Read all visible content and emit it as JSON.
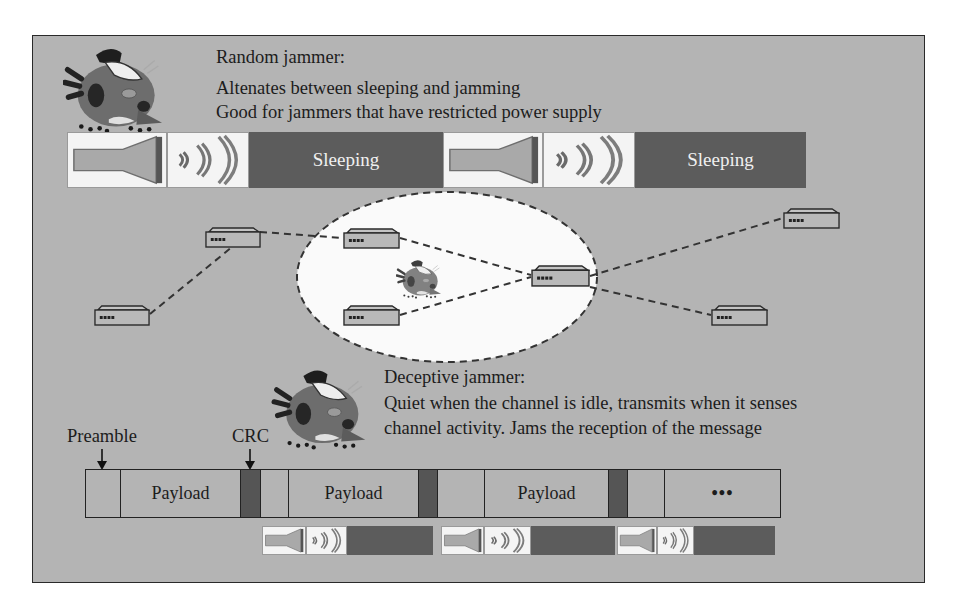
{
  "colors": {
    "panel_bg": "#b4b4b4",
    "dark_block": "#5c5c5c",
    "crc_block": "#555555",
    "white_area": "#f4f4f4",
    "line": "#2a2a2a"
  },
  "random_jammer": {
    "title": "Random jammer:",
    "line1": "Altenates between sleeping and jamming",
    "line2": "Good for jammers that have restricted power supply",
    "icon": "jammer-creature-icon",
    "timeline": [
      {
        "type": "jamming",
        "icon": "speaker-icon"
      },
      {
        "type": "waves",
        "icon": "radio-waves-icon"
      },
      {
        "type": "sleeping",
        "label": "Sleeping"
      },
      {
        "type": "jamming",
        "icon": "speaker-icon"
      },
      {
        "type": "waves",
        "icon": "radio-waves-icon"
      },
      {
        "type": "sleeping",
        "label": "Sleeping"
      }
    ]
  },
  "network": {
    "jamming_region": "dashed-ellipse",
    "jammer_icon": "jammer-creature-icon",
    "nodes": [
      {
        "id": "n1",
        "icon": "network-node-icon",
        "inside_region": false
      },
      {
        "id": "n2",
        "icon": "network-node-icon",
        "inside_region": true
      },
      {
        "id": "n3",
        "icon": "network-node-icon",
        "inside_region": true
      },
      {
        "id": "n4",
        "icon": "network-node-icon",
        "inside_region": true
      },
      {
        "id": "n5",
        "icon": "network-node-icon",
        "inside_region": false
      },
      {
        "id": "n6",
        "icon": "network-node-icon",
        "inside_region": false
      },
      {
        "id": "n7",
        "icon": "network-node-icon",
        "inside_region": false
      }
    ],
    "links": [
      [
        "n7",
        "n1"
      ],
      [
        "n1",
        "n2"
      ],
      [
        "n2",
        "n4"
      ],
      [
        "n3",
        "n4"
      ],
      [
        "n4",
        "n5"
      ],
      [
        "n4",
        "n6"
      ]
    ]
  },
  "deceptive_jammer": {
    "title": "Deceptive jammer:",
    "line1": "Quiet when the channel is idle, transmits when it senses",
    "line2": "channel activity. Jams the reception of the message",
    "icon": "jammer-creature-icon"
  },
  "frame": {
    "preamble_label": "Preamble",
    "crc_label": "CRC",
    "segments": [
      {
        "type": "preamble",
        "label": ""
      },
      {
        "type": "payload",
        "label": "Payload"
      },
      {
        "type": "crc",
        "label": ""
      },
      {
        "type": "gap",
        "label": ""
      },
      {
        "type": "payload",
        "label": "Payload"
      },
      {
        "type": "crc",
        "label": ""
      },
      {
        "type": "gap",
        "label": ""
      },
      {
        "type": "payload",
        "label": "Payload"
      },
      {
        "type": "crc",
        "label": ""
      },
      {
        "type": "gap",
        "label": ""
      },
      {
        "type": "more",
        "label": "•••"
      }
    ],
    "jam_bursts": [
      {
        "icons": [
          "speaker-icon",
          "radio-waves-icon"
        ],
        "block": "dark"
      },
      {
        "icons": [
          "speaker-icon",
          "radio-waves-icon"
        ],
        "block": "dark"
      },
      {
        "icons": [
          "speaker-icon",
          "radio-waves-icon"
        ],
        "block": "dark"
      }
    ]
  }
}
